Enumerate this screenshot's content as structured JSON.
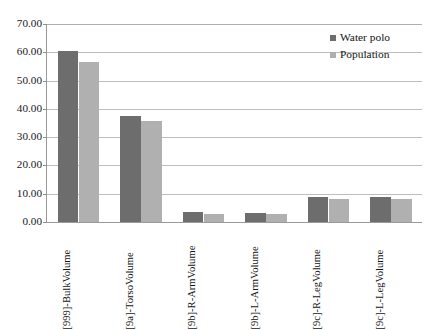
{
  "chart_data": {
    "type": "bar",
    "title": "",
    "subtitle": "",
    "xlabel": "",
    "ylabel": "",
    "ylim": [
      0,
      70
    ],
    "ytick_step": 10,
    "grid": true,
    "grid_axis": "y",
    "legend_position": "top-right",
    "ytick_labels": [
      "70.00",
      "60.00",
      "50.00",
      "40.00",
      "30.00",
      "20.00",
      "10.00",
      "0.00"
    ],
    "ytick_values": [
      70,
      60,
      50,
      40,
      30,
      20,
      10,
      0
    ],
    "categories": [
      "[999]-BulkVolume",
      "[9a]-TorsoVolume",
      "[9b]-R-ArmVolume",
      "[9b]-L-ArmVolume",
      "[9c]-R-LegVolume",
      "[9c]-L-LegVolume"
    ],
    "series": [
      {
        "name": "Water polo",
        "color": "#6d6d6d",
        "values": [
          60.4,
          37.5,
          3.7,
          3.1,
          8.8,
          8.7
        ]
      },
      {
        "name": "Population",
        "color": "#b0b0b0",
        "values": [
          56.5,
          35.7,
          3.0,
          2.8,
          8.1,
          8.1
        ]
      }
    ],
    "annotations": []
  },
  "legend": {
    "items": [
      {
        "label": "Water polo",
        "color": "#6d6d6d"
      },
      {
        "label": "Population",
        "color": "#b0b0b0"
      }
    ]
  },
  "colors": {
    "series_water_polo": "#6d6d6d",
    "series_population": "#b0b0b0",
    "gridline": "#bdbdbd",
    "axis": "#9a9a9a",
    "text": "#141414",
    "background": "#ffffff"
  }
}
